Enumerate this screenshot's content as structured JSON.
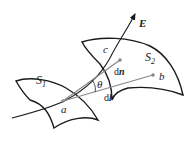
{
  "diagram": {
    "labels": {
      "E": "E",
      "c": "c",
      "S1_main": "S",
      "S1_sub": "1",
      "S2_main": "S",
      "S2_sub": "2",
      "theta": "θ",
      "dn_d": "d",
      "dn_n": "n",
      "dl_d": "d",
      "dl_l": "l",
      "a": "a",
      "b": "b"
    },
    "colors": {
      "stroke": "#1a1a1a",
      "vector": "#888888",
      "background": "#ffffff"
    }
  }
}
